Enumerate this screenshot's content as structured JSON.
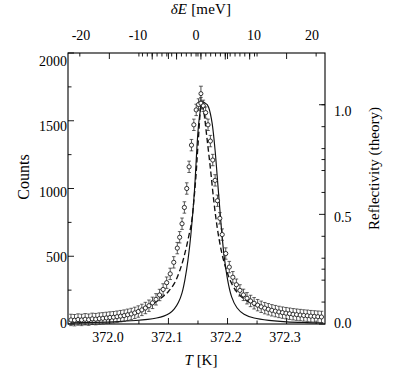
{
  "chart_data": {
    "type": "line",
    "title": "",
    "xlabel": "T [K]",
    "ylabel": "Counts",
    "x2label": "δE [meV]",
    "y2label": "Reflectivity (theory)",
    "xlim": [
      371.93,
      372.365
    ],
    "ylim": [
      0,
      2000
    ],
    "x2lim": [
      -24.5,
      22.6
    ],
    "y2lim": [
      0.0,
      1.236
    ],
    "grid": false,
    "legend": null,
    "xticks": [
      372.0,
      372.1,
      372.2,
      372.3
    ],
    "xticklabels": [
      "372.0",
      "372.1",
      "372.2",
      "372.3"
    ],
    "x2ticks": [
      -20,
      -10,
      0,
      10,
      20
    ],
    "x2ticklabels": [
      "-20",
      "-10",
      "0",
      "10",
      "20"
    ],
    "yticks": [
      0,
      500,
      1000,
      1500,
      2000
    ],
    "yticklabels": [
      "0",
      "500",
      "1000",
      "1500",
      "2000"
    ],
    "y2ticks": [
      0.0,
      0.5,
      1.0
    ],
    "y2ticklabels": [
      "0.0",
      "0.5",
      "1.0"
    ],
    "minor_ticks": true,
    "peak": {
      "center_K": 372.155,
      "height_counts": 1620
    },
    "series": [
      {
        "name": "measured counts",
        "style": "open-circle-markers-with-error-bars",
        "x": [
          371.935,
          371.941,
          371.947,
          371.953,
          371.959,
          371.965,
          371.971,
          371.977,
          371.983,
          371.989,
          371.995,
          372.001,
          372.007,
          372.013,
          372.019,
          372.025,
          372.031,
          372.037,
          372.043,
          372.049,
          372.055,
          372.061,
          372.067,
          372.073,
          372.079,
          372.085,
          372.091,
          372.097,
          372.103,
          372.109,
          372.115,
          372.119,
          372.123,
          372.127,
          372.131,
          372.135,
          372.139,
          372.143,
          372.147,
          372.151,
          372.155,
          372.159,
          372.163,
          372.167,
          372.171,
          372.175,
          372.179,
          372.183,
          372.187,
          372.191,
          372.197,
          372.203,
          372.209,
          372.215,
          372.221,
          372.227,
          372.233,
          372.239,
          372.245,
          372.251,
          372.257,
          372.263,
          372.269,
          372.275,
          372.281,
          372.287,
          372.293,
          372.299,
          372.305,
          372.311,
          372.317,
          372.323,
          372.329,
          372.335,
          372.341,
          372.347,
          372.353,
          372.359
        ],
        "y": [
          30,
          28,
          33,
          30,
          35,
          32,
          38,
          36,
          40,
          42,
          45,
          48,
          50,
          54,
          58,
          62,
          68,
          74,
          82,
          92,
          104,
          118,
          135,
          156,
          182,
          214,
          255,
          305,
          370,
          455,
          560,
          640,
          740,
          860,
          1000,
          1160,
          1320,
          1470,
          1580,
          1620,
          1630,
          1610,
          1560,
          1470,
          1350,
          1210,
          1060,
          910,
          780,
          660,
          520,
          420,
          345,
          290,
          248,
          215,
          190,
          170,
          153,
          139,
          127,
          117,
          109,
          101,
          95,
          89,
          84,
          80,
          76,
          72,
          69,
          66,
          63,
          61,
          58,
          56,
          54,
          52
        ],
        "yerr": 42
      },
      {
        "name": "fit to data (dashed)",
        "style": "dashed",
        "x": [
          371.935,
          371.955,
          371.975,
          371.995,
          372.015,
          372.035,
          372.055,
          372.075,
          372.09,
          372.1,
          372.11,
          372.118,
          372.126,
          372.134,
          372.14,
          372.146,
          372.15,
          372.155,
          372.16,
          372.165,
          372.171,
          372.177,
          372.183,
          372.19,
          372.198,
          372.208,
          372.22,
          372.235,
          372.255,
          372.28,
          372.31,
          372.34,
          372.362
        ],
        "y": [
          30,
          34,
          40,
          48,
          60,
          78,
          106,
          152,
          200,
          240,
          300,
          380,
          490,
          640,
          780,
          1060,
          1320,
          1610,
          1560,
          1380,
          1150,
          900,
          700,
          530,
          400,
          290,
          215,
          165,
          125,
          98,
          75,
          60,
          52
        ]
      },
      {
        "name": "reflectivity theory (solid)",
        "style": "solid",
        "x": [
          371.935,
          371.975,
          372.015,
          372.045,
          372.065,
          372.08,
          372.092,
          372.102,
          372.11,
          372.117,
          372.123,
          372.128,
          372.133,
          372.138,
          372.144,
          372.15,
          372.156,
          372.162,
          372.168,
          372.174,
          372.179,
          372.184,
          372.189,
          372.194,
          372.2,
          372.207,
          372.216,
          372.228,
          372.245,
          372.27,
          372.3,
          372.335,
          372.362
        ],
        "y": [
          8,
          12,
          18,
          26,
          34,
          44,
          58,
          80,
          112,
          160,
          230,
          330,
          470,
          660,
          980,
          1420,
          1620,
          1630,
          1600,
          1480,
          1280,
          1010,
          740,
          510,
          330,
          200,
          120,
          72,
          44,
          27,
          16,
          10,
          7
        ]
      }
    ]
  }
}
